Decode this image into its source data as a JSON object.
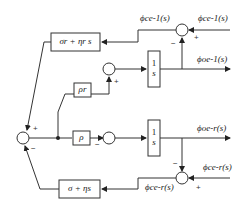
{
  "diagram": {
    "type": "control block diagram",
    "blocks": {
      "top_controller": "σr + ηr s",
      "rho_r": "ρr",
      "rho": "ρ",
      "integrator_top": {
        "num": "1",
        "den": "s"
      },
      "integrator_bottom": {
        "num": "1",
        "den": "s"
      },
      "bottom_controller": "σ + ηs"
    },
    "signals": {
      "top_error": "ϕce-1(s)",
      "top_reference": "ϕce-1(s)",
      "top_output": "ϕoe-1(s)",
      "bottom_output": "ϕoe-r(s)",
      "bottom_reference": "ϕce-r(s)",
      "bottom_error": "ϕce-r(s)"
    },
    "signs": {
      "top_sum_feedback": "−",
      "top_sum_reference": "+",
      "mid_sum_plus": "+",
      "left_sum_top": "+",
      "left_sum_bottom": "−",
      "rho_sum_minus": "−",
      "bottom_sum_feedback": "−",
      "bottom_sum_reference": "+"
    },
    "colors": {
      "line": "#333333",
      "text": "#222222",
      "background": "#ffffff"
    }
  }
}
